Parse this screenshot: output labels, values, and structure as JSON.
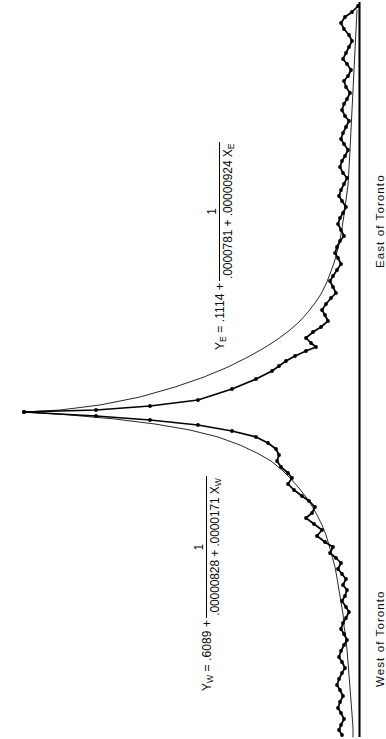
{
  "figure": {
    "ink_color": "#000000",
    "background_color": "#ffffff"
  },
  "axis": {
    "baseline_name": "vertical-reference-axis",
    "labels": {
      "east": "East of Toronto",
      "west": "West of Toronto"
    }
  },
  "equations": {
    "east": {
      "lhs": "Y",
      "lhs_sub": "E",
      "equals_and_intercept": " =  .1114 + ",
      "numerator": "1",
      "denominator": ".0000781 + .00000924 X",
      "denominator_sub": "E",
      "plain": "Y_E = .1114 + 1 / (.0000781 + .00000924 X_E)"
    },
    "west": {
      "lhs": "Y",
      "lhs_sub": "W",
      "equals_and_intercept": " = .6089 + ",
      "numerator": "1",
      "denominator": ".00000828 + .0000171 X",
      "denominator_sub": "W",
      "plain": "Y_W = .6089 + 1 / (.00000828 + .0000171 X_W)"
    }
  },
  "chart_data": {
    "type": "line",
    "title": "",
    "subtitle": "",
    "xlabel": "",
    "ylabel": "",
    "orientation": "rotated-90-clockwise",
    "grid": false,
    "legend_position": "none",
    "annotations": [
      {
        "name": "east-equation",
        "text": "Y_E = .1114 + 1 / (.0000781 + .00000924 X_E)"
      },
      {
        "name": "west-equation",
        "text": "Y_W = .6089 + 1 / (.00000828 + .0000171 X_W)"
      },
      {
        "name": "east-axis-label",
        "text": "East of Toronto"
      },
      {
        "name": "west-axis-label",
        "text": "West of Toronto"
      }
    ],
    "axis_ranges": {
      "x": [
        0,
        739
      ],
      "y": [
        0,
        379
      ]
    },
    "series": [
      {
        "name": "observed-data-east",
        "style": "markers-with-segments",
        "points": [
          [
            358,
            6
          ],
          [
            352,
            12
          ],
          [
            345,
            17
          ],
          [
            341,
            23
          ],
          [
            344,
            29
          ],
          [
            349,
            35
          ],
          [
            352,
            41
          ],
          [
            349,
            47
          ],
          [
            346,
            53
          ],
          [
            343,
            59
          ],
          [
            347,
            64
          ],
          [
            351,
            70
          ],
          [
            348,
            76
          ],
          [
            344,
            81
          ],
          [
            346,
            87
          ],
          [
            350,
            93
          ],
          [
            347,
            99
          ],
          [
            344,
            104
          ],
          [
            342,
            110
          ],
          [
            345,
            116
          ],
          [
            349,
            121
          ],
          [
            346,
            127
          ],
          [
            343,
            133
          ],
          [
            341,
            139
          ],
          [
            344,
            144
          ],
          [
            348,
            150
          ],
          [
            345,
            156
          ],
          [
            342,
            161
          ],
          [
            340,
            167
          ],
          [
            343,
            173
          ],
          [
            347,
            178
          ],
          [
            344,
            184
          ],
          [
            341,
            190
          ],
          [
            339,
            196
          ],
          [
            342,
            201
          ],
          [
            346,
            207
          ],
          [
            343,
            213
          ],
          [
            340,
            218
          ],
          [
            338,
            224
          ],
          [
            341,
            230
          ],
          [
            344,
            236
          ],
          [
            340,
            241
          ],
          [
            337,
            247
          ],
          [
            335,
            253
          ],
          [
            338,
            258
          ],
          [
            341,
            264
          ],
          [
            337,
            270
          ],
          [
            333,
            276
          ],
          [
            330,
            281
          ],
          [
            333,
            287
          ],
          [
            336,
            293
          ],
          [
            331,
            298
          ],
          [
            326,
            304
          ],
          [
            322,
            310
          ],
          [
            325,
            315
          ],
          [
            328,
            321
          ],
          [
            321,
            327
          ],
          [
            313,
            332
          ],
          [
            306,
            338
          ],
          [
            311,
            343
          ],
          [
            316,
            347
          ],
          [
            306,
            351
          ],
          [
            295,
            356
          ],
          [
            286,
            361
          ],
          [
            279,
            366
          ],
          [
            272,
            371
          ],
          [
            256,
            379
          ],
          [
            232,
            389
          ],
          [
            198,
            400
          ],
          [
            150,
            406
          ],
          [
            96,
            410
          ],
          [
            24,
            412
          ]
        ]
      },
      {
        "name": "fitted-curve-east",
        "style": "smooth-thin",
        "points": [
          [
            357,
            10
          ],
          [
            356,
            30
          ],
          [
            355,
            50
          ],
          [
            354,
            70
          ],
          [
            353,
            90
          ],
          [
            352,
            110
          ],
          [
            351,
            130
          ],
          [
            350,
            150
          ],
          [
            349,
            168
          ],
          [
            348,
            185
          ],
          [
            346,
            200
          ],
          [
            344,
            215
          ],
          [
            342,
            228
          ],
          [
            340,
            240
          ],
          [
            337,
            252
          ],
          [
            334,
            263
          ],
          [
            330,
            274
          ],
          [
            326,
            284
          ],
          [
            321,
            294
          ],
          [
            315,
            303
          ],
          [
            308,
            312
          ],
          [
            300,
            321
          ],
          [
            290,
            330
          ],
          [
            278,
            339
          ],
          [
            264,
            348
          ],
          [
            248,
            357
          ],
          [
            228,
            367
          ],
          [
            204,
            377
          ],
          [
            175,
            387
          ],
          [
            140,
            397
          ],
          [
            100,
            405
          ],
          [
            60,
            410
          ],
          [
            24,
            412
          ]
        ]
      },
      {
        "name": "observed-data-west",
        "style": "markers-with-segments",
        "points": [
          [
            24,
            412
          ],
          [
            96,
            416
          ],
          [
            150,
            420
          ],
          [
            198,
            425
          ],
          [
            232,
            431
          ],
          [
            256,
            437
          ],
          [
            268,
            443
          ],
          [
            276,
            449
          ],
          [
            279,
            455
          ],
          [
            277,
            461
          ],
          [
            281,
            467
          ],
          [
            288,
            473
          ],
          [
            292,
            478
          ],
          [
            288,
            484
          ],
          [
            294,
            490
          ],
          [
            302,
            496
          ],
          [
            309,
            501
          ],
          [
            315,
            507
          ],
          [
            312,
            513
          ],
          [
            306,
            518
          ],
          [
            314,
            524
          ],
          [
            322,
            530
          ],
          [
            317,
            536
          ],
          [
            325,
            542
          ],
          [
            333,
            547
          ],
          [
            330,
            553
          ],
          [
            336,
            558
          ],
          [
            341,
            563
          ],
          [
            338,
            569
          ],
          [
            342,
            574
          ],
          [
            346,
            579
          ],
          [
            343,
            585
          ],
          [
            347,
            590
          ],
          [
            345,
            596
          ],
          [
            342,
            601
          ],
          [
            346,
            607
          ],
          [
            349,
            612
          ],
          [
            346,
            618
          ],
          [
            343,
            623
          ],
          [
            341,
            629
          ],
          [
            344,
            634
          ],
          [
            347,
            640
          ],
          [
            344,
            645
          ],
          [
            341,
            651
          ],
          [
            339,
            657
          ],
          [
            342,
            662
          ],
          [
            345,
            668
          ],
          [
            342,
            673
          ],
          [
            339,
            679
          ],
          [
            337,
            685
          ],
          [
            340,
            690
          ],
          [
            343,
            696
          ],
          [
            340,
            702
          ],
          [
            338,
            708
          ],
          [
            341,
            713
          ],
          [
            344,
            719
          ],
          [
            341,
            725
          ],
          [
            339,
            730
          ],
          [
            342,
            735
          ]
        ]
      },
      {
        "name": "fitted-curve-west",
        "style": "smooth-thin",
        "points": [
          [
            24,
            412
          ],
          [
            70,
            415
          ],
          [
            115,
            419
          ],
          [
            155,
            424
          ],
          [
            190,
            430
          ],
          [
            218,
            437
          ],
          [
            240,
            445
          ],
          [
            257,
            453
          ],
          [
            271,
            461
          ],
          [
            282,
            470
          ],
          [
            291,
            479
          ],
          [
            299,
            488
          ],
          [
            306,
            497
          ],
          [
            312,
            506
          ],
          [
            317,
            515
          ],
          [
            322,
            525
          ],
          [
            326,
            535
          ],
          [
            329,
            545
          ],
          [
            332,
            556
          ],
          [
            335,
            567
          ],
          [
            337,
            578
          ],
          [
            339,
            590
          ],
          [
            341,
            602
          ],
          [
            343,
            614
          ],
          [
            344,
            626
          ],
          [
            346,
            638
          ],
          [
            347,
            650
          ],
          [
            348,
            662
          ],
          [
            349,
            675
          ],
          [
            350,
            688
          ],
          [
            351,
            701
          ],
          [
            352,
            714
          ],
          [
            353,
            728
          ],
          [
            353,
            737
          ]
        ]
      }
    ]
  }
}
